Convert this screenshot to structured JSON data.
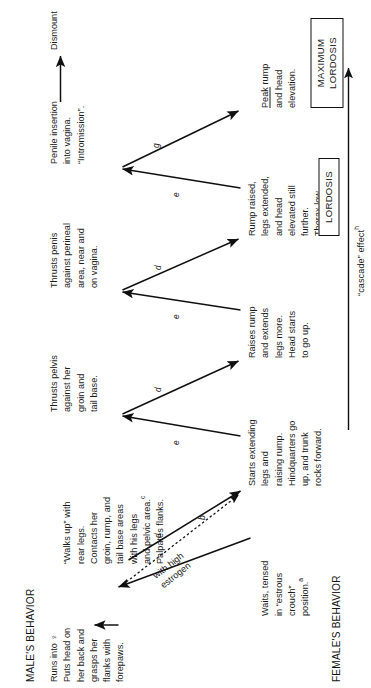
{
  "figure": {
    "rows": {
      "male_label": "MALE'S BEHAVIOR",
      "female_label": "FEMALE'S BEHAVIOR"
    },
    "male_steps": [
      {
        "id": "m1",
        "text": "Runs into ♀\nPuts head on\nher back and\ngrasps her\nflanks with\nforepaws."
      },
      {
        "id": "m2",
        "text": "“Walks up” with\nrear legs.\nContacts her\ngroin, rump, and\ntail base areas\nwith his legs\nand pelvic area.",
        "superscript": "c",
        "extra_line": "Palpates flanks."
      },
      {
        "id": "m3",
        "text": "Thrusts pelvis\nagainst her\ngroin and\ntail base."
      },
      {
        "id": "m4",
        "text": "Thrusts penis\nagainst perineal\narea, near and\non vagina."
      },
      {
        "id": "m5",
        "text": "Penile insertion\ninto vagina.\n“Intromission”."
      },
      {
        "id": "m6",
        "text": "Dismount"
      }
    ],
    "female_steps": [
      {
        "id": "f1",
        "text": "Waits, tensed\nin “estrous\ncrouch”\nposition.",
        "superscript": "a"
      },
      {
        "id": "f2",
        "text": "Starts extending\nlegs and\nraising rump.\nHindquarters go\nup, and trunk\nrocks forward."
      },
      {
        "id": "f3",
        "text": "Raises rump\nand extends\nlegs more.\nHead starts\nto go up."
      },
      {
        "id": "f4",
        "text": "Rump raised,\nlegs extended,\nand head\nelevated still\nfurther.\nThorax low."
      },
      {
        "id": "f5",
        "text": "Peak rump\nand head\nelevation.",
        "underline_first_word": "Peak"
      }
    ],
    "edge_letters": {
      "estrogen_edge": "b",
      "m2_to_f2": "d",
      "f2_to_m3": "e",
      "m3_to_f3": "d",
      "f3_to_m4": "e",
      "m4_to_f4": "d",
      "f4_to_m5": "e",
      "m5_to_f5": "g"
    },
    "annotations": {
      "estrogen": "with high\nestrogen",
      "cascade": "“cascade” effect",
      "cascade_superscript": "h"
    },
    "boxes": [
      {
        "id": "lordosis",
        "text": "LORDOSIS"
      },
      {
        "id": "maximum-lordosis",
        "text": "MAXIMUM\nLORDOSIS"
      }
    ],
    "colors": {
      "ink": "#1a1a1a",
      "background": "#ffffff",
      "arrow": "#101010"
    }
  }
}
